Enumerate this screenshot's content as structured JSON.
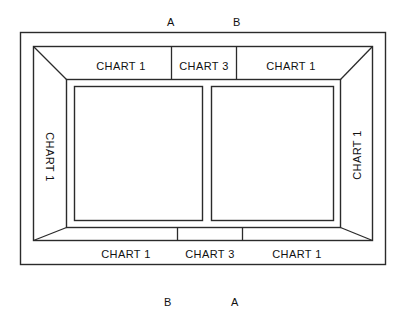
{
  "diagram": {
    "line_color": "#2b2b2b",
    "background_color": "#ffffff",
    "bands": {
      "top": [
        {
          "name": "top-left-band",
          "label": "CHART 1"
        },
        {
          "name": "top-center-band",
          "label": "CHART 3"
        },
        {
          "name": "top-right-band",
          "label": "CHART 1"
        }
      ],
      "bottom": [
        {
          "name": "bottom-left-band",
          "label": "CHART 1"
        },
        {
          "name": "bottom-center-band",
          "label": "CHART 3"
        },
        {
          "name": "bottom-right-band",
          "label": "CHART 1"
        }
      ],
      "left": {
        "name": "left-band",
        "label": "CHART 1"
      },
      "right": {
        "name": "right-band",
        "label": "CHART 1"
      }
    },
    "section_markers": {
      "top": [
        {
          "name": "section-marker-a-top",
          "label": "A"
        },
        {
          "name": "section-marker-b-top",
          "label": "B"
        }
      ],
      "bottom": [
        {
          "name": "section-marker-b-bottom",
          "label": "B"
        },
        {
          "name": "section-marker-a-bottom",
          "label": "A"
        }
      ]
    },
    "panels": [
      {
        "name": "left-panel",
        "label": ""
      },
      {
        "name": "right-panel",
        "label": ""
      }
    ]
  }
}
